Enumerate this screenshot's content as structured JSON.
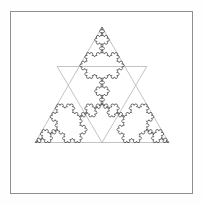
{
  "figure": {
    "title": "Koch Snowflake",
    "background_color": "#ffffff",
    "canvas": {
      "width": 202,
      "height": 205
    }
  },
  "frame": {
    "name": "plot-border",
    "x": 10,
    "y": 11,
    "width": 182,
    "height": 182,
    "stroke_color": "#8f8f8f",
    "stroke_width": 1,
    "fill_color": "#ffffff"
  },
  "fractal": {
    "type": "koch-snowflake",
    "iterations": 4,
    "orientation": "apex-up",
    "stroke_color": "#3a3a3a",
    "stroke_width": 0.7,
    "fill": "none",
    "base_triangle": {
      "visible": true,
      "stroke_color": "#b4b4b4",
      "stroke_width": 0.8,
      "vertices": [
        {
          "label": "top",
          "x": 102.0,
          "y": 27.0
        },
        {
          "label": "bottom-right",
          "x": 168.7,
          "y": 142.5
        },
        {
          "label": "bottom-left",
          "x": 35.3,
          "y": 142.5
        }
      ],
      "side_length": 133.4
    },
    "bounds": {
      "left": 35.3,
      "right": 168.7,
      "top": 27.0,
      "bottom": 180.0
    },
    "center": {
      "x": 102.0,
      "y": 104.0
    },
    "inner_star_triangle": {
      "visible": true,
      "stroke_color": "#b4b4b4",
      "vertices": [
        {
          "label": "left",
          "x": 57.2,
          "y": 66.5
        },
        {
          "label": "right",
          "x": 146.8,
          "y": 66.5
        },
        {
          "label": "bottom",
          "x": 102.0,
          "y": 142.5
        }
      ]
    }
  },
  "chart_data": {
    "type": "line",
    "title": "Koch Snowflake",
    "xlabel": "",
    "ylabel": "",
    "series": [
      {
        "name": "koch-curve-iteration-4",
        "color": "#3a3a3a"
      },
      {
        "name": "construction-triangle",
        "color": "#b4b4b4"
      }
    ]
  }
}
